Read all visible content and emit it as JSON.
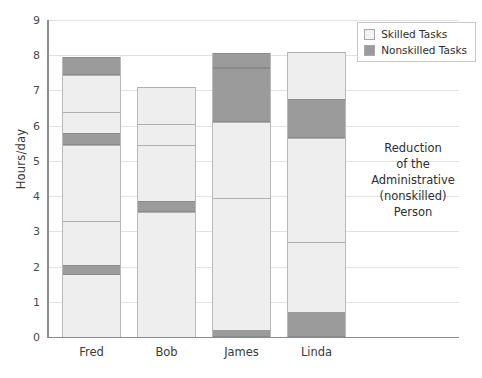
{
  "chart_data": {
    "type": "bar",
    "stacked": true,
    "title": "",
    "xlabel": "",
    "ylabel": "Hours/day",
    "ylim": [
      0,
      9
    ],
    "ytick_labels": [
      "0",
      "1",
      "2",
      "3",
      "4",
      "5",
      "6",
      "7",
      "8",
      "9"
    ],
    "grid": true,
    "legend_position": "top-right",
    "categories": [
      "Fred",
      "Bob",
      "James",
      "Linda"
    ],
    "legend": [
      "Skilled Tasks",
      "Nonskilled Tasks"
    ],
    "colors": {
      "skilled": "#eeeeee",
      "nonskilled": "#9b9b9b",
      "axis": "#8c8c8c",
      "grid": "#e2e2e2"
    },
    "totals": [
      7.95,
      7.1,
      8.05,
      8.1
    ],
    "series": [
      {
        "name": "Skilled Tasks",
        "values": [
          6.35,
          6.8,
          5.9,
          5.9
        ]
      },
      {
        "name": "Nonskilled Tasks",
        "values": [
          1.6,
          0.3,
          2.15,
          2.2
        ]
      }
    ],
    "bars": [
      {
        "category": "Fred",
        "total": 7.95,
        "segments": [
          {
            "type": "skilled",
            "from": 0.0,
            "to": 1.75
          },
          {
            "type": "nonskilled",
            "from": 1.75,
            "to": 2.05
          },
          {
            "type": "skilled",
            "from": 2.05,
            "to": 3.3
          },
          {
            "type": "skilled",
            "from": 3.3,
            "to": 5.45
          },
          {
            "type": "nonskilled",
            "from": 5.45,
            "to": 5.8
          },
          {
            "type": "skilled",
            "from": 5.8,
            "to": 6.4
          },
          {
            "type": "skilled",
            "from": 6.4,
            "to": 7.45
          },
          {
            "type": "nonskilled",
            "from": 7.45,
            "to": 7.95
          }
        ]
      },
      {
        "category": "Bob",
        "total": 7.1,
        "segments": [
          {
            "type": "skilled",
            "from": 0.0,
            "to": 0.85
          },
          {
            "type": "skilled",
            "from": 0.85,
            "to": 3.55
          },
          {
            "type": "nonskilled",
            "from": 3.55,
            "to": 3.85
          },
          {
            "type": "skilled",
            "from": 3.85,
            "to": 5.45
          },
          {
            "type": "skilled",
            "from": 5.45,
            "to": 6.05
          },
          {
            "type": "skilled",
            "from": 6.05,
            "to": 7.1
          }
        ]
      },
      {
        "category": "James",
        "total": 8.05,
        "segments": [
          {
            "type": "nonskilled",
            "from": 0.0,
            "to": 0.2
          },
          {
            "type": "skilled",
            "from": 0.2,
            "to": 3.95
          },
          {
            "type": "skilled",
            "from": 3.95,
            "to": 6.1
          },
          {
            "type": "nonskilled",
            "from": 6.1,
            "to": 7.65
          },
          {
            "type": "nonskilled",
            "from": 7.65,
            "to": 8.05
          }
        ]
      },
      {
        "category": "Linda",
        "total": 8.1,
        "segments": [
          {
            "type": "nonskilled",
            "from": 0.0,
            "to": 0.7
          },
          {
            "type": "skilled",
            "from": 0.7,
            "to": 2.7
          },
          {
            "type": "skilled",
            "from": 2.7,
            "to": 5.65
          },
          {
            "type": "nonskilled",
            "from": 5.65,
            "to": 6.75
          },
          {
            "type": "skilled",
            "from": 6.75,
            "to": 8.1
          }
        ]
      }
    ],
    "annotation": {
      "lines": [
        "Reduction",
        "of the",
        "Administrative",
        "(nonskilled)",
        "Person"
      ]
    }
  }
}
